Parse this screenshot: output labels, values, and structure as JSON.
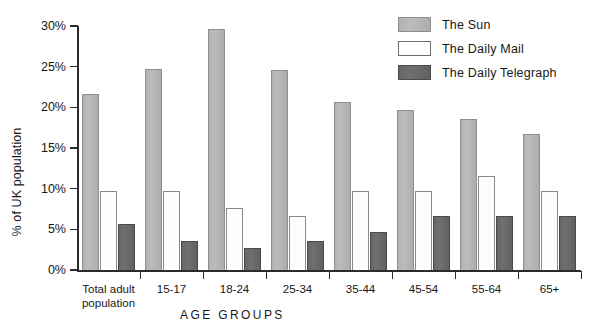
{
  "chart_data": {
    "type": "bar",
    "title": "",
    "xlabel": "AGE GROUPS",
    "ylabel": "% of UK population",
    "categories": [
      "Total adult\npopulation",
      "15-17",
      "18-24",
      "25-34",
      "35-44",
      "45-54",
      "55-64",
      "65+"
    ],
    "series": [
      {
        "name": "The Sun",
        "color": "#b5b5b5",
        "values": [
          21.6,
          24.7,
          29.6,
          24.6,
          20.6,
          19.7,
          18.6,
          16.7
        ]
      },
      {
        "name": "The Daily Mail",
        "color": "#ffffff",
        "values": [
          9.7,
          9.7,
          7.6,
          6.6,
          9.7,
          9.7,
          11.6,
          9.7
        ]
      },
      {
        "name": "The Daily Telegraph",
        "color": "#666666",
        "values": [
          5.7,
          3.6,
          2.7,
          3.6,
          4.7,
          6.6,
          6.6,
          6.6
        ]
      }
    ],
    "ylim": [
      0,
      30
    ],
    "yticks": [
      0,
      5,
      10,
      15,
      20,
      25,
      30
    ],
    "ytick_labels": [
      "0%",
      "5%",
      "10%",
      "15%",
      "20%",
      "25%",
      "30%"
    ],
    "grid": false,
    "legend_position": "top-right"
  },
  "legend": {
    "items": [
      {
        "label": "The Sun",
        "swatch": "sun-swatch"
      },
      {
        "label": "The Daily Mail",
        "swatch": "mail-swatch"
      },
      {
        "label": "The Daily Telegraph",
        "swatch": "telegraph-swatch"
      }
    ]
  },
  "axes": {
    "y_title": "% of UK population",
    "x_title": "AGE GROUPS"
  }
}
